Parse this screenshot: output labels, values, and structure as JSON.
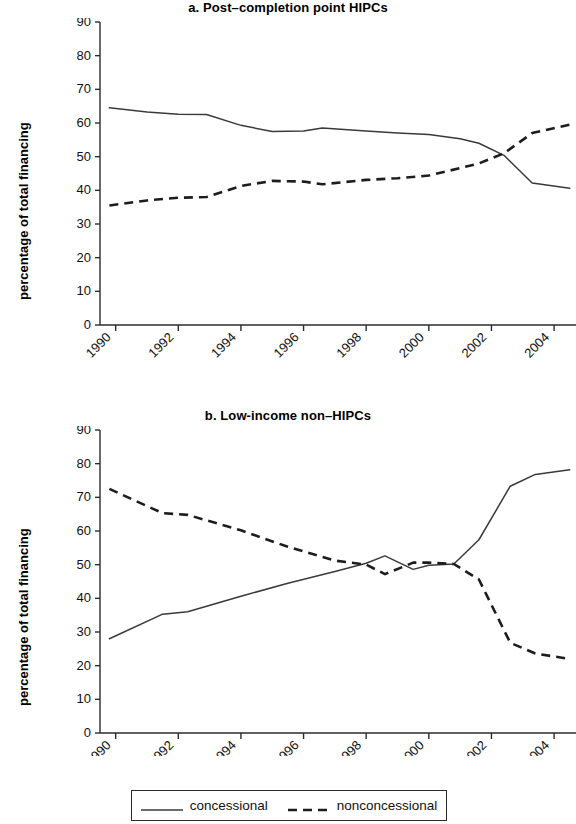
{
  "figure": {
    "ylabel": "percentage of total financing",
    "ylabel_b": "percentage of total financing",
    "legend": {
      "concessional_label": "concessional",
      "nonconcessional_label": "nonconcessional"
    },
    "colors": {
      "concessional": "#3a3a3a",
      "nonconcessional": "#1d1d1d",
      "axis": "#2b2b2b",
      "background": "#ffffff"
    }
  },
  "chart_data": [
    {
      "type": "line",
      "title": "a. Post–completion point HIPCs",
      "xlabel": "",
      "ylabel": "percentage of total financing",
      "ylim": [
        0,
        90
      ],
      "xlim": [
        1989.5,
        2004.7
      ],
      "yticks": [
        0,
        10,
        20,
        30,
        40,
        50,
        60,
        70,
        80,
        90
      ],
      "xticks": [
        1990,
        1992,
        1994,
        1996,
        1998,
        2000,
        2002,
        2004
      ],
      "xtick_labels": [
        "1990",
        "1992",
        "1994",
        "1996",
        "1998",
        "2000",
        "2002",
        "2004"
      ],
      "grid": false,
      "legend_position": "below-figure",
      "x": [
        1989.8,
        1991.0,
        1992.0,
        1992.9,
        1994.0,
        1995.0,
        1996.0,
        1996.6,
        1998.0,
        1999.0,
        2000.0,
        2001.0,
        2001.6,
        2002.4,
        2003.3,
        2004.5
      ],
      "series": [
        {
          "name": "concessional",
          "style": "solid",
          "values": [
            64.5,
            63.3,
            62.6,
            62.5,
            59.3,
            57.5,
            57.6,
            58.5,
            57.6,
            57.0,
            56.6,
            55.3,
            54.0,
            50.4,
            42.2,
            40.6
          ]
        },
        {
          "name": "nonconcessional",
          "style": "dashed",
          "values": [
            35.5,
            37.0,
            37.8,
            38.0,
            41.3,
            42.8,
            42.6,
            41.8,
            43.1,
            43.6,
            44.4,
            46.6,
            48.0,
            51.0,
            57.0,
            59.5
          ]
        }
      ]
    },
    {
      "type": "line",
      "title": "b. Low-income non–HIPCs",
      "xlabel": "",
      "ylabel": "percentage of total financing",
      "ylim": [
        0,
        90
      ],
      "xlim": [
        1989.5,
        2004.7
      ],
      "yticks": [
        0,
        10,
        20,
        30,
        40,
        50,
        60,
        70,
        80,
        90
      ],
      "xticks": [
        1990,
        1992,
        1994,
        1996,
        1998,
        2000,
        2002,
        2004
      ],
      "xtick_labels": [
        "1990",
        "1992",
        "1994",
        "1996",
        "1998",
        "2000",
        "2002",
        "2004"
      ],
      "grid": false,
      "legend_position": "below-figure",
      "x": [
        1989.8,
        1991.5,
        1992.3,
        1994.0,
        1995.5,
        1997.0,
        1998.0,
        1998.6,
        1999.5,
        2000.0,
        2000.8,
        2001.6,
        2002.6,
        2003.4,
        2004.5
      ],
      "series": [
        {
          "name": "concessional",
          "style": "solid",
          "values": [
            28.0,
            35.3,
            36.0,
            40.6,
            44.5,
            48.0,
            50.4,
            52.6,
            48.6,
            49.8,
            50.2,
            57.4,
            73.3,
            76.8,
            78.2
          ]
        },
        {
          "name": "nonconcessional",
          "style": "dashed",
          "values": [
            72.5,
            65.3,
            64.8,
            60.2,
            55.3,
            51.2,
            50.0,
            47.2,
            50.6,
            50.6,
            50.2,
            45.6,
            26.8,
            23.6,
            22.0
          ]
        }
      ]
    }
  ]
}
